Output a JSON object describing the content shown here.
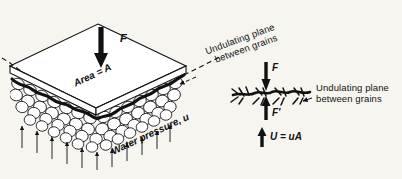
{
  "figure": {
    "type": "diagram",
    "background_color": "#f7f5f0",
    "ink_color": "#111111"
  },
  "left_diagram": {
    "name": "isometric-soil-block",
    "applied_force_label": "F",
    "area_label": "Area = A",
    "water_pressure_label": "Water pressure, u",
    "plane_callout": {
      "line1": "Undulating plane",
      "line2": "between grains"
    },
    "notes": {
      "plate": "rectangular plate drawn in isometric view resting on soil grains",
      "grains": "rounded soil grains packed below the plate",
      "undulating_line": "bold wavy line tracing grain-to-grain contacts",
      "pressure_arrows": "thin upward arrows beneath the grains"
    }
  },
  "right_diagram": {
    "name": "force-balance-detail",
    "force_down_label": "F",
    "force_up_label": "F'",
    "uplift_label": "U = uA",
    "plane_callout": {
      "line1": "Undulating plane",
      "line2": "between grains"
    },
    "notes": {
      "plane": "jagged undulating contact plane shown edge-on",
      "arrows": "downward F above the plane, upward F' and U = uA below"
    }
  }
}
